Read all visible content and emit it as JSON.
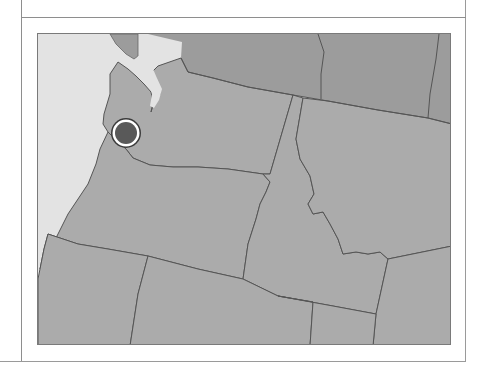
{
  "header": {
    "title": ""
  },
  "map": {
    "caption": "Map of the Pacific Northwest with a location marker near the Washington/Oregon coast",
    "regions": [
      {
        "name": "Pacific Ocean",
        "kind": "water"
      },
      {
        "name": "Canada",
        "kind": "country"
      },
      {
        "name": "Washington",
        "kind": "state"
      },
      {
        "name": "Oregon",
        "kind": "state"
      },
      {
        "name": "Idaho",
        "kind": "state"
      },
      {
        "name": "Montana",
        "kind": "state"
      },
      {
        "name": "Wyoming",
        "kind": "state"
      },
      {
        "name": "California",
        "kind": "state"
      },
      {
        "name": "Nevada",
        "kind": "state"
      },
      {
        "name": "Utah",
        "kind": "state"
      }
    ],
    "marker": {
      "label": "Location marker",
      "position_px": {
        "x": 125,
        "y": 132
      }
    },
    "colors": {
      "ocean": "#e3e3e3",
      "canada": "#9c9c9c",
      "states": "#ababab",
      "borders": "#555555",
      "marker_fill": "#595959",
      "marker_ring": "#ffffff",
      "marker_outline": "#3a3a3a"
    }
  }
}
